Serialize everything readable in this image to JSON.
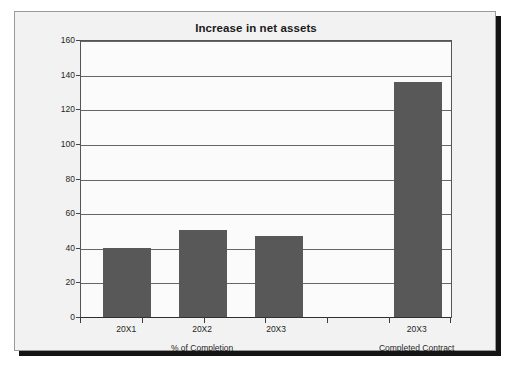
{
  "chart_data": {
    "type": "bar",
    "title": "Increase in net assets",
    "xlabel": "",
    "ylabel": "",
    "ylim": [
      0,
      160
    ],
    "ytick_values": [
      0,
      20,
      40,
      60,
      80,
      100,
      120,
      140,
      160
    ],
    "ytick_labels": [
      "0",
      "20",
      "40",
      "60",
      "80",
      "100",
      "120",
      "140",
      "160"
    ],
    "grid": true,
    "legend": "none",
    "bar_color": "#585858",
    "plot_background": "#fbfbfb",
    "panel_background": "#f2f2f2",
    "categories": [
      "20X1",
      "20X2",
      "20X3",
      "20X3"
    ],
    "values": [
      40,
      50,
      47,
      136
    ],
    "groups": [
      {
        "label": "% of Completion",
        "categories": [
          "20X1",
          "20X2",
          "20X3"
        ],
        "values": [
          40,
          50,
          47
        ]
      },
      {
        "label": "Completed Contract",
        "categories": [
          "20X3"
        ],
        "values": [
          136
        ]
      }
    ],
    "bars": [
      {
        "category": "20X1",
        "group": "% of Completion",
        "value": 40,
        "x_left_pct": 6.0,
        "width_pct": 13.0
      },
      {
        "category": "20X2",
        "group": "% of Completion",
        "value": 50,
        "x_left_pct": 26.5,
        "width_pct": 13.0
      },
      {
        "category": "20X3",
        "group": "% of Completion",
        "value": 47,
        "x_left_pct": 47.0,
        "width_pct": 13.0
      },
      {
        "category": "20X3",
        "group": "Completed Contract",
        "value": 136,
        "x_left_pct": 84.5,
        "width_pct": 13.0
      }
    ],
    "category_tick_positions_pct": [
      0,
      16.7,
      33.4,
      50.0,
      66.7,
      83.4,
      100
    ],
    "category_label_positions_pct": [
      12.5,
      33.0,
      53.0,
      91.0
    ],
    "group_label_positions_pct": [
      33.0,
      91.0
    ]
  }
}
